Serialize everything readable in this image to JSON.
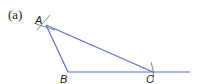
{
  "figure": {
    "caption": "(a)",
    "line_color": "#5b6fc7",
    "arc_color": "#777777",
    "points": {
      "A": {
        "label": "A",
        "x": 46,
        "y": 25
      },
      "B": {
        "label": "B",
        "x": 68,
        "y": 72
      },
      "C": {
        "label": "C",
        "x": 153,
        "y": 72
      }
    },
    "segments": [
      "AB",
      "AC",
      "BC (ray extended beyond C)"
    ],
    "construction_arcs": [
      "arcs intersecting at A",
      "arc crossing at C"
    ]
  }
}
